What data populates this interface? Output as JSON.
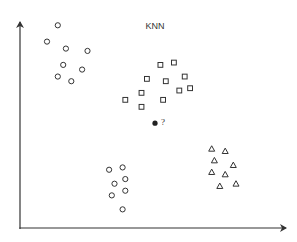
{
  "diagram": {
    "title": "KNN",
    "query_label": "?",
    "colors": {
      "ink": "#333333",
      "background": "#ffffff"
    },
    "axes": {
      "x_arrow": true,
      "y_arrow": true
    },
    "classes": [
      {
        "name": "class-circle-top",
        "marker": "circle",
        "points": [
          [
            0.14,
            0.87
          ],
          [
            0.1,
            0.8
          ],
          [
            0.17,
            0.77
          ],
          [
            0.25,
            0.76
          ],
          [
            0.16,
            0.7
          ],
          [
            0.23,
            0.68
          ],
          [
            0.14,
            0.65
          ],
          [
            0.19,
            0.63
          ]
        ]
      },
      {
        "name": "class-square",
        "marker": "square",
        "points": [
          [
            0.52,
            0.7
          ],
          [
            0.57,
            0.71
          ],
          [
            0.47,
            0.64
          ],
          [
            0.54,
            0.63
          ],
          [
            0.61,
            0.65
          ],
          [
            0.45,
            0.58
          ],
          [
            0.53,
            0.55
          ],
          [
            0.59,
            0.59
          ],
          [
            0.63,
            0.6
          ],
          [
            0.39,
            0.55
          ],
          [
            0.45,
            0.52
          ]
        ]
      },
      {
        "name": "class-circle-bottom",
        "marker": "circle",
        "points": [
          [
            0.33,
            0.25
          ],
          [
            0.38,
            0.26
          ],
          [
            0.35,
            0.19
          ],
          [
            0.39,
            0.21
          ],
          [
            0.34,
            0.14
          ],
          [
            0.39,
            0.16
          ],
          [
            0.38,
            0.08
          ]
        ]
      },
      {
        "name": "class-triangle",
        "marker": "triangle",
        "points": [
          [
            0.71,
            0.34
          ],
          [
            0.76,
            0.33
          ],
          [
            0.72,
            0.29
          ],
          [
            0.79,
            0.27
          ],
          [
            0.71,
            0.24
          ],
          [
            0.76,
            0.23
          ],
          [
            0.8,
            0.19
          ],
          [
            0.74,
            0.18
          ]
        ]
      }
    ],
    "query_point": [
      0.5,
      0.45
    ]
  }
}
